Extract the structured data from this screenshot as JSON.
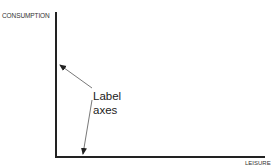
{
  "diagram": {
    "y_axis_label": "CONSUMPTION",
    "x_axis_label": "LEISURE",
    "annotation_line1": "Label",
    "annotation_line2": "axes",
    "colors": {
      "axis": "#222222",
      "arrow": "#555555",
      "text": "#222222"
    }
  }
}
